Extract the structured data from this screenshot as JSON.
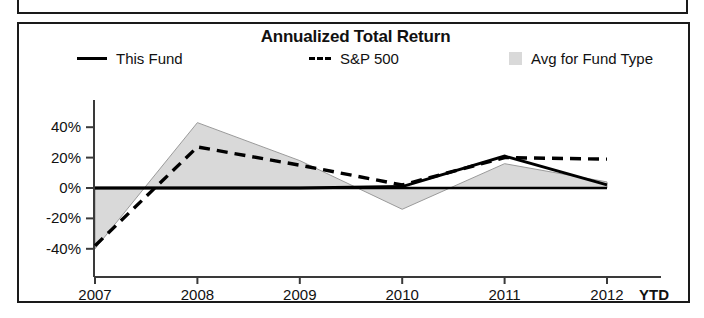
{
  "chart_data": {
    "type": "line",
    "title": "Annualized Total Return",
    "xlabel": "",
    "ylabel": "",
    "grid": false,
    "legend_position": "top",
    "categories": [
      "2007",
      "2008",
      "2009",
      "2010",
      "2011",
      "2012"
    ],
    "x_axis_suffix": "YTD",
    "ylim": [
      -50,
      50
    ],
    "yticks": [
      40,
      20,
      0,
      -20,
      -40
    ],
    "ytick_labels": [
      "40%",
      "20%",
      "0%",
      "-20%",
      "-40%"
    ],
    "series": [
      {
        "name": "This Fund",
        "style": "solid",
        "color": "#000000",
        "values": [
          0,
          0,
          0,
          1,
          21,
          2
        ]
      },
      {
        "name": "S&P 500",
        "style": "dashed",
        "color": "#000000",
        "values": [
          -38,
          27,
          15,
          2,
          20,
          19
        ]
      },
      {
        "name": "Avg for Fund Type",
        "style": "area",
        "color": "#d9d9d9",
        "values": [
          -40,
          43,
          18,
          -14,
          16,
          4
        ]
      }
    ]
  },
  "legend": {
    "items": [
      {
        "label": "This Fund",
        "swatch": "solid-line-swatch"
      },
      {
        "label": "S&P 500",
        "swatch": "dashed-line-swatch"
      },
      {
        "label": "Avg for Fund Type",
        "swatch": "gray-area-swatch"
      }
    ]
  },
  "axis": {
    "y_labels": [
      "40%",
      "20%",
      "0%",
      "-20%",
      "-40%"
    ],
    "x_labels": [
      "2007",
      "2008",
      "2009",
      "2010",
      "2011",
      "2012"
    ],
    "x_suffix": "YTD"
  }
}
